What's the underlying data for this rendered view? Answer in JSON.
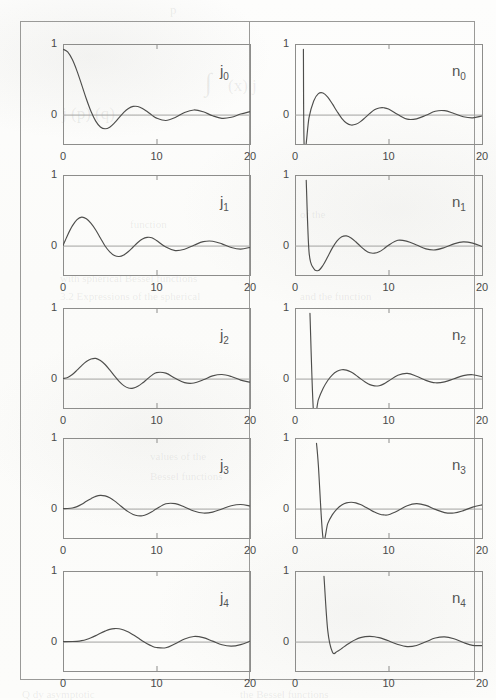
{
  "figure": {
    "title": "",
    "columns": [
      "j",
      "n"
    ],
    "x_axis": {
      "min": 0,
      "max": 20,
      "ticks": [
        0,
        10,
        20
      ],
      "tick_labels": [
        "0",
        "10",
        "20"
      ]
    },
    "y_axis": {
      "min": -0.45,
      "max": 1.08,
      "ticks": [
        0,
        1
      ],
      "tick_labels": [
        "0",
        "1"
      ]
    }
  },
  "chart_data": {
    "type": "line",
    "xlabel": "x",
    "ylabel": "",
    "xlim": [
      0,
      20
    ],
    "ylim": [
      -0.45,
      1.08
    ],
    "grid": false,
    "legend": "in-panel annotation, upper right",
    "x_ticks": [
      0,
      10,
      20
    ],
    "y_ticks": [
      0,
      1
    ],
    "panels": [
      {
        "row": 1,
        "col": 1,
        "label": "j",
        "order": 0,
        "label_text": "j0",
        "function": "j_0(x) = sin(x)/x",
        "x": [
          0,
          0.5,
          1,
          1.5,
          2,
          2.5,
          3,
          3.5,
          4,
          4.5,
          5,
          5.5,
          6,
          6.5,
          7,
          7.5,
          8,
          8.5,
          9,
          9.5,
          10,
          11,
          12,
          13,
          14,
          15,
          16,
          17,
          18,
          19,
          20
        ],
        "y": [
          1.0,
          0.959,
          0.841,
          0.665,
          0.455,
          0.239,
          0.047,
          -0.1,
          -0.189,
          -0.217,
          -0.192,
          -0.128,
          -0.047,
          0.033,
          0.094,
          0.125,
          0.124,
          0.094,
          0.046,
          -0.008,
          -0.054,
          -0.091,
          -0.045,
          0.032,
          0.071,
          0.043,
          -0.018,
          -0.057,
          -0.041,
          0.008,
          0.046
        ]
      },
      {
        "row": 1,
        "col": 2,
        "label": "n",
        "order": 0,
        "label_text": "n0",
        "function": "n_0(x) = -cos(x)/x",
        "x": [
          0.9,
          1,
          1.5,
          2,
          2.5,
          3,
          3.5,
          4,
          4.5,
          5,
          5.5,
          6,
          6.5,
          7,
          7.5,
          8,
          8.5,
          9,
          9.5,
          10,
          11,
          12,
          13,
          14,
          15,
          16,
          17,
          18,
          19,
          20
        ],
        "y": [
          1.0,
          -0.54,
          -0.047,
          0.208,
          0.32,
          0.33,
          0.268,
          0.163,
          0.047,
          -0.057,
          -0.129,
          -0.16,
          -0.149,
          -0.108,
          -0.047,
          0.018,
          0.074,
          0.101,
          0.104,
          0.084,
          0.0,
          -0.07,
          -0.065,
          -0.011,
          0.051,
          0.06,
          0.016,
          -0.033,
          -0.05,
          -0.021
        ]
      },
      {
        "row": 2,
        "col": 1,
        "label": "j",
        "order": 1,
        "label_text": "j1",
        "function": "j_1(x) = sin(x)/x^2 - cos(x)/x",
        "x": [
          0,
          0.5,
          1,
          1.5,
          2,
          2.5,
          3,
          3.5,
          4,
          4.5,
          5,
          5.5,
          6,
          6.5,
          7,
          7.5,
          8,
          8.5,
          9,
          9.5,
          10,
          11,
          12,
          13,
          14,
          15,
          16,
          17,
          18,
          19,
          20
        ],
        "y": [
          0.0,
          0.163,
          0.301,
          0.397,
          0.435,
          0.41,
          0.339,
          0.238,
          0.116,
          -0.006,
          -0.095,
          -0.151,
          -0.167,
          -0.144,
          -0.091,
          -0.022,
          0.047,
          0.1,
          0.125,
          0.12,
          0.078,
          -0.023,
          -0.076,
          -0.056,
          0.005,
          0.06,
          0.067,
          0.026,
          -0.03,
          -0.054,
          -0.027
        ]
      },
      {
        "row": 2,
        "col": 2,
        "label": "n",
        "order": 1,
        "label_text": "n1",
        "function": "n_1(x) = -cos(x)/x^2 - sin(x)/x",
        "x": [
          1.2,
          1.5,
          2,
          2.5,
          3,
          3.5,
          4,
          4.5,
          5,
          5.5,
          6,
          6.5,
          7,
          7.5,
          8,
          8.5,
          9,
          9.5,
          10,
          11,
          12,
          13,
          14,
          15,
          16,
          17,
          18,
          19,
          20
        ],
        "y": [
          1.0,
          -0.096,
          -0.35,
          -0.381,
          -0.3,
          -0.171,
          -0.035,
          0.072,
          0.135,
          0.148,
          0.117,
          0.058,
          -0.01,
          -0.07,
          -0.11,
          -0.116,
          -0.095,
          -0.05,
          0.005,
          0.081,
          0.065,
          0.009,
          -0.051,
          -0.066,
          -0.03,
          0.026,
          0.056,
          0.037,
          -0.014
        ]
      },
      {
        "row": 3,
        "col": 1,
        "label": "j",
        "order": 2,
        "label_text": "j2",
        "function": "j_2(x)",
        "x": [
          0,
          0.5,
          1,
          1.5,
          2,
          2.5,
          3,
          3.5,
          4,
          4.5,
          5,
          5.5,
          6,
          6.5,
          7,
          7.5,
          8,
          8.5,
          9,
          9.5,
          10,
          11,
          12,
          13,
          14,
          15,
          16,
          17,
          18,
          19,
          20
        ],
        "y": [
          0.0,
          0.017,
          0.063,
          0.129,
          0.199,
          0.26,
          0.299,
          0.309,
          0.276,
          0.216,
          0.132,
          0.041,
          -0.043,
          -0.108,
          -0.144,
          -0.146,
          -0.118,
          -0.068,
          -0.008,
          0.049,
          0.092,
          0.083,
          0.004,
          -0.062,
          -0.068,
          -0.019,
          0.041,
          0.063,
          0.032,
          -0.023,
          -0.055
        ]
      },
      {
        "row": 3,
        "col": 2,
        "label": "n",
        "order": 2,
        "label_text": "n2",
        "function": "n_2(x)",
        "x": [
          1.6,
          2,
          2.5,
          3,
          3.5,
          4,
          4.5,
          5,
          5.5,
          6,
          6.5,
          7,
          7.5,
          8,
          8.5,
          9,
          9.5,
          10,
          11,
          12,
          13,
          14,
          15,
          16,
          17,
          18,
          19,
          20
        ],
        "y": [
          1.0,
          -0.56,
          -0.321,
          -0.152,
          -0.029,
          0.058,
          0.111,
          0.135,
          0.13,
          0.1,
          0.053,
          -0.001,
          -0.051,
          -0.092,
          -0.112,
          -0.109,
          -0.081,
          -0.038,
          0.05,
          0.08,
          0.037,
          -0.027,
          -0.064,
          -0.051,
          -0.003,
          0.045,
          0.059,
          0.029
        ]
      },
      {
        "row": 4,
        "col": 1,
        "label": "j",
        "order": 3,
        "label_text": "j3",
        "function": "j_3(x)",
        "x": [
          0,
          0.5,
          1,
          1.5,
          2,
          2.5,
          3,
          3.5,
          4,
          4.5,
          5,
          5.5,
          6,
          6.5,
          7,
          7.5,
          8,
          8.5,
          9,
          9.5,
          10,
          11,
          12,
          13,
          14,
          15,
          16,
          17,
          18,
          19,
          20
        ],
        "y": [
          0.0,
          0.001,
          0.009,
          0.03,
          0.066,
          0.112,
          0.152,
          0.187,
          0.203,
          0.194,
          0.165,
          0.118,
          0.061,
          0.002,
          -0.05,
          -0.09,
          -0.11,
          -0.109,
          -0.086,
          -0.049,
          -0.004,
          0.073,
          0.076,
          0.025,
          -0.037,
          -0.068,
          -0.054,
          -0.006,
          0.043,
          0.062,
          0.04
        ]
      },
      {
        "row": 4,
        "col": 2,
        "label": "n",
        "order": 3,
        "label_text": "n3",
        "function": "n_3(x)",
        "x": [
          2.3,
          2.5,
          3,
          3.5,
          4,
          4.5,
          5,
          5.5,
          6,
          6.5,
          7,
          7.5,
          8,
          8.5,
          9,
          9.5,
          10,
          11,
          12,
          13,
          14,
          15,
          16,
          17,
          18,
          19,
          20
        ],
        "y": [
          1.0,
          0.66,
          -0.452,
          -0.23,
          -0.092,
          -0.003,
          0.055,
          0.087,
          0.097,
          0.088,
          0.062,
          0.026,
          -0.014,
          -0.052,
          -0.082,
          -0.097,
          -0.094,
          -0.033,
          0.044,
          0.075,
          0.049,
          -0.012,
          -0.061,
          -0.067,
          -0.031,
          0.022,
          0.057
        ]
      },
      {
        "row": 5,
        "col": 1,
        "label": "j",
        "order": 4,
        "label_text": "j4",
        "function": "j_4(x)",
        "x": [
          0,
          1,
          1.5,
          2,
          2.5,
          3,
          3.5,
          4,
          4.5,
          5,
          5.5,
          6,
          6.5,
          7,
          7.5,
          8,
          8.5,
          9,
          9.5,
          10,
          11,
          12,
          13,
          14,
          15,
          16,
          17,
          18,
          19,
          20
        ],
        "y": [
          0.0,
          0.001,
          0.004,
          0.014,
          0.032,
          0.058,
          0.091,
          0.128,
          0.16,
          0.187,
          0.199,
          0.196,
          0.177,
          0.146,
          0.104,
          0.058,
          0.01,
          -0.033,
          -0.068,
          -0.09,
          -0.095,
          -0.033,
          0.04,
          0.078,
          0.061,
          0.007,
          -0.049,
          -0.07,
          -0.046,
          0.006
        ]
      },
      {
        "row": 5,
        "col": 2,
        "label": "n",
        "order": 4,
        "label_text": "n4",
        "function": "n_4(x)",
        "x": [
          3.1,
          3.5,
          4,
          4.5,
          5,
          5.5,
          6,
          6.5,
          7,
          7.5,
          8,
          8.5,
          9,
          9.5,
          10,
          11,
          12,
          13,
          14,
          15,
          16,
          17,
          18,
          19,
          20
        ],
        "y": [
          1.0,
          0.172,
          -0.16,
          -0.151,
          -0.105,
          -0.053,
          -0.005,
          0.033,
          0.06,
          0.075,
          0.08,
          0.074,
          0.06,
          0.038,
          0.012,
          -0.044,
          -0.076,
          -0.059,
          -0.003,
          0.054,
          0.073,
          0.043,
          -0.014,
          -0.058,
          -0.062
        ]
      }
    ]
  },
  "ghost_text": [
    {
      "t": "p",
      "x": 170,
      "y": 2,
      "size": 13
    },
    {
      "t": "∫",
      "x": 205,
      "y": 68,
      "size": 26
    },
    {
      "t": "(x) j",
      "x": 228,
      "y": 76,
      "size": 17
    },
    {
      "t": "j  (p)  (q)",
      "x": 62,
      "y": 104,
      "size": 17
    },
    {
      "t": "function",
      "x": 130,
      "y": 218,
      "size": 11
    },
    {
      "t": "of the",
      "x": 300,
      "y": 208,
      "size": 11
    },
    {
      "t": "with  spherical Bessel  functions",
      "x": 60,
      "y": 272,
      "size": 11
    },
    {
      "t": "3.2  Expressions  of  the  spherical",
      "x": 60,
      "y": 290,
      "size": 11
    },
    {
      "t": "and  the  function",
      "x": 300,
      "y": 290,
      "size": 11
    },
    {
      "t": "values of  the",
      "x": 150,
      "y": 450,
      "size": 11
    },
    {
      "t": "Bessel  functions",
      "x": 150,
      "y": 470,
      "size": 11
    },
    {
      "t": "Q  dy  asymptotic",
      "x": 22,
      "y": 688,
      "size": 11
    },
    {
      "t": "the  Bessel  functions",
      "x": 240,
      "y": 688,
      "size": 11
    }
  ]
}
